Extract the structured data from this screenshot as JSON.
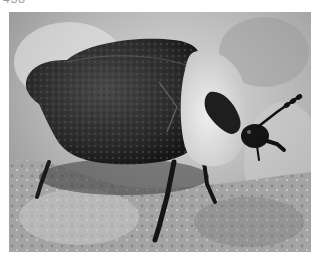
{
  "caption": {
    "text": "438"
  },
  "photo": {
    "subject": "carrion beetle on rock",
    "colors": {
      "background_light": "#d8d8d8",
      "background_mid": "#a8a8a8",
      "rock": "#9c9c9c",
      "beetle_body": "#2a2a2a",
      "pronotum": "#e2e2e2",
      "pronotum_mark": "#1e1e1e"
    }
  }
}
